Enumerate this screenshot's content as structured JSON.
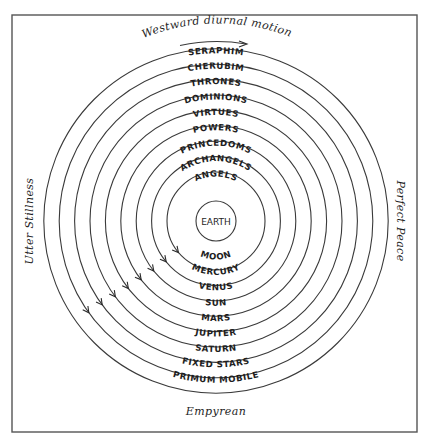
{
  "title_top": "Westward diurnal motion",
  "label_left": "Utter Stillness",
  "label_right": "Perfect Peace",
  "label_bottom": "Empyrean",
  "center_label": "EARTH",
  "angelic_orders": [
    "SERAPHIM",
    "CHERUBIM",
    "THRONES",
    "DOMINIONS",
    "VIRTUES",
    "POWERS",
    "PRINCEDOMS",
    "ARCHANGELS",
    "ANGELS"
  ],
  "celestial_spheres": [
    "MOON",
    "MERCURY",
    "VENUS",
    "SUN",
    "MARS",
    "JUPITER",
    "SATURN",
    "FIXED STARS",
    "PRIMUM MOBILE"
  ],
  "colors": {
    "ink": "#1e1e1e",
    "lines": "#3a3a3a",
    "background": "#ffffff"
  }
}
